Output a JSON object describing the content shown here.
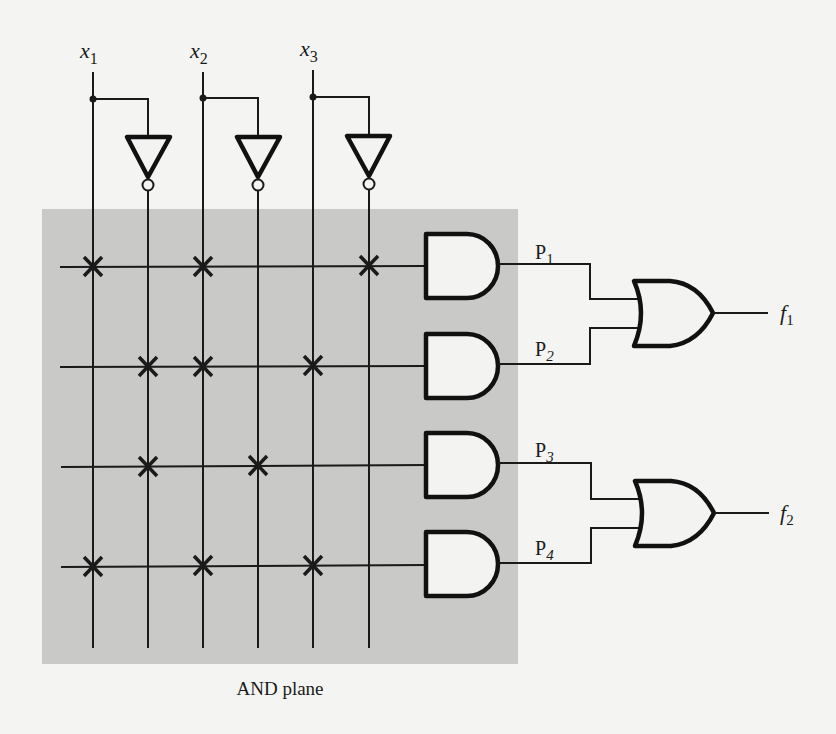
{
  "diagram": {
    "type": "PLA (programmable logic array)",
    "inputs": [
      {
        "id": "x1",
        "label": "x",
        "sub": "1",
        "x": 93,
        "inv_x": 148
      },
      {
        "id": "x2",
        "label": "x",
        "sub": "2",
        "x": 203,
        "inv_x": 258
      },
      {
        "id": "x3",
        "label": "x",
        "sub": "3",
        "x": 313,
        "inv_x": 369
      }
    ],
    "and_plane": {
      "label": "AND plane",
      "fill": "#c9c9c7",
      "rows": [
        {
          "id": "P1",
          "label": "P",
          "sub": "1",
          "y": 267,
          "connections": [
            "x1",
            "x2",
            "x3_bar"
          ]
        },
        {
          "id": "P2",
          "label": "P",
          "sub": "2",
          "y": 367,
          "connections": [
            "x1_bar",
            "x2",
            "x3"
          ]
        },
        {
          "id": "P3",
          "label": "P",
          "sub": "3",
          "y": 466,
          "connections": [
            "x1_bar",
            "x2_bar"
          ]
        },
        {
          "id": "P4",
          "label": "P",
          "sub": "4",
          "y": 566,
          "connections": [
            "x1",
            "x2",
            "x3"
          ]
        }
      ]
    },
    "or_gates": [
      {
        "id": "f1",
        "label": "f",
        "sub": "1",
        "inputs": [
          "P1",
          "P2"
        ]
      },
      {
        "id": "f2",
        "label": "f",
        "sub": "2",
        "inputs": [
          "P3",
          "P4"
        ]
      }
    ],
    "colors": {
      "line": "#1a1a1a",
      "background": "#f4f4f2",
      "and_plane": "#c9c9c7",
      "gate_fill": "#f3f3f1"
    }
  }
}
